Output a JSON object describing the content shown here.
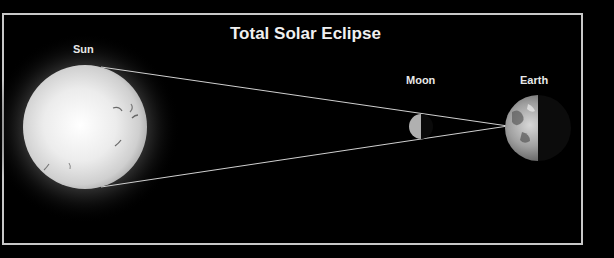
{
  "diagram": {
    "title": "Total Solar Eclipse",
    "bodies": [
      {
        "name": "Sun",
        "label": "Sun"
      },
      {
        "name": "Moon",
        "label": "Moon"
      },
      {
        "name": "Earth",
        "label": "Earth"
      }
    ]
  },
  "colors": {
    "background": "#000000",
    "frame": "#c8c8c8",
    "text": "#e8e8e8",
    "ray": "#d0d0d0"
  }
}
